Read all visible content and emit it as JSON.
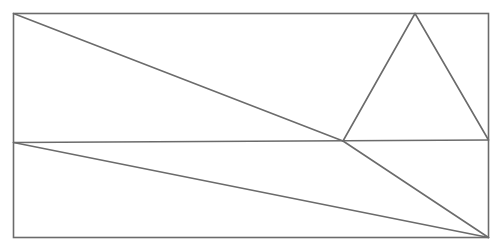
{
  "diagram": {
    "type": "geometric-figure",
    "colors": {
      "stroke": "#6b6b6b",
      "background": "#ffffff"
    },
    "points": {
      "top_left": "A",
      "top_apex": "T",
      "left_mid": "M",
      "center_point": "P",
      "right_mid": "R",
      "bottom_left": "D",
      "bottom_right": "B"
    },
    "segments": [
      {
        "name": "outer-rectangle",
        "from": "A",
        "to": "B",
        "kind": "rectangle"
      },
      {
        "name": "horizontal-divider",
        "from": "M",
        "to": "R"
      },
      {
        "name": "diagonal-top-left-to-center",
        "from": "A",
        "to": "P"
      },
      {
        "name": "diagonal-center-to-bottom-right",
        "from": "P",
        "to": "B"
      },
      {
        "name": "diagonal-left-mid-to-bottom-right",
        "from": "M",
        "to": "B"
      },
      {
        "name": "triangle-left-side",
        "from": "P",
        "to": "T"
      },
      {
        "name": "triangle-right-side",
        "from": "T",
        "to": "R"
      }
    ]
  }
}
